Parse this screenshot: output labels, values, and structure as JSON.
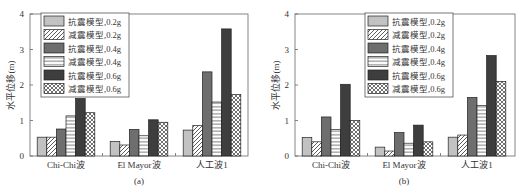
{
  "chart_data": [
    {
      "type": "bar",
      "caption": "(a)",
      "title": "",
      "xlabel": "",
      "ylabel": "水平位移(m)",
      "ylim": [
        0,
        4
      ],
      "yticks": [
        "0",
        "1",
        "2",
        "3",
        "4"
      ],
      "grid": false,
      "legend_position": "top-left",
      "categories": [
        "Chi-Chi波",
        "El Mayor波",
        "人工波1"
      ],
      "series": [
        {
          "name": "抗震模型,0.2g",
          "style": "solid-light",
          "values": [
            0.53,
            0.41,
            0.73
          ]
        },
        {
          "name": "减震模型,0.2g",
          "style": "diagonal-hatch",
          "values": [
            0.53,
            0.31,
            0.86
          ]
        },
        {
          "name": "抗震模型,0.4g",
          "style": "solid-medium",
          "values": [
            0.76,
            0.75,
            2.37
          ]
        },
        {
          "name": "减震模型,0.4g",
          "style": "horizontal-hatch",
          "values": [
            1.13,
            0.57,
            1.52
          ]
        },
        {
          "name": "抗震模型,0.6g",
          "style": "solid-dark",
          "values": [
            1.62,
            1.02,
            3.58
          ]
        },
        {
          "name": "减震模型,0.6g",
          "style": "cross-hatch",
          "values": [
            1.22,
            0.95,
            1.73
          ]
        }
      ]
    },
    {
      "type": "bar",
      "caption": "(b)",
      "title": "",
      "xlabel": "",
      "ylabel": "水平位移(m)",
      "ylim": [
        0,
        4
      ],
      "yticks": [
        "0",
        "1",
        "2",
        "3",
        "4"
      ],
      "grid": false,
      "legend_position": "top-center",
      "categories": [
        "Chi-Chi波",
        "El Mayor波",
        "人工波1"
      ],
      "series": [
        {
          "name": "抗震模型,0.2g",
          "style": "solid-light",
          "values": [
            0.52,
            0.25,
            0.53
          ]
        },
        {
          "name": "减震模型,0.2g",
          "style": "diagonal-hatch",
          "values": [
            0.4,
            0.14,
            0.59
          ]
        },
        {
          "name": "抗震模型,0.4g",
          "style": "solid-medium",
          "values": [
            1.1,
            0.66,
            1.65
          ]
        },
        {
          "name": "减震模型,0.4g",
          "style": "horizontal-hatch",
          "values": [
            0.75,
            0.36,
            1.42
          ]
        },
        {
          "name": "抗震模型,0.6g",
          "style": "solid-dark",
          "values": [
            2.02,
            0.87,
            2.83
          ]
        },
        {
          "name": "减震模型,0.6g",
          "style": "cross-hatch",
          "values": [
            1.0,
            0.4,
            2.1
          ]
        }
      ]
    }
  ],
  "colors": {
    "solid-light": "#c2c2c2",
    "solid-medium": "#6e6e6e",
    "solid-dark": "#3e3e3e",
    "hatch-line": "#333333",
    "axis": "#555555"
  }
}
